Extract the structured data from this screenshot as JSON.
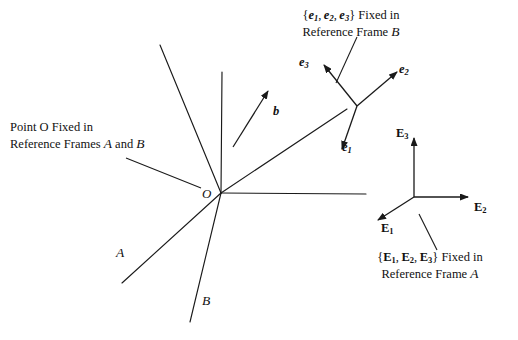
{
  "figure": {
    "type": "vector-frames-diagram",
    "background_color": "#ffffff",
    "line_color": "#1a1a1a"
  },
  "annotations": {
    "point_o_caption_line1": "Point O Fixed in",
    "point_o_caption_line2": "Reference Frames A and B",
    "point_o_caption_line2_parts": {
      "prefix": "Reference Frames ",
      "frame_a": "A",
      "conjunction": " and ",
      "frame_b": "B"
    },
    "e_basis_caption_line1": "{e1, e2, e3} Fixed in",
    "e_basis_caption_line2": "Reference Frame B",
    "E_basis_caption_line1": "{E1, E2, E3} Fixed in",
    "E_basis_caption_line2": "Reference Frame A"
  },
  "labels": {
    "origin": "O",
    "vector_b": "b",
    "e1": "e",
    "e1_sub": "1",
    "e2": "e",
    "e2_sub": "2",
    "e3": "e",
    "e3_sub": "3",
    "E1": "E",
    "E1_sub": "1",
    "E2": "E",
    "E2_sub": "2",
    "E3": "E",
    "E3_sub": "3",
    "frame_A_axis": "A",
    "frame_B_axis": "B"
  },
  "geometry": {
    "origin_point": [
      221,
      193
    ],
    "e_triad_vertex": [
      357,
      106
    ],
    "E_triad_vertex": [
      414,
      197
    ],
    "rays_from_origin": [
      {
        "name": "vertical-up",
        "to": [
          222,
          72
        ]
      },
      {
        "name": "upper-left-diagonal",
        "to": [
          160,
          45
        ]
      },
      {
        "name": "upper-right-long-diagonal",
        "to": [
          347,
          109
        ]
      },
      {
        "name": "horizontal-right",
        "to": [
          366,
          194
        ]
      },
      {
        "name": "lower-left-frame-a",
        "to": [
          122,
          283
        ]
      },
      {
        "name": "lower-down-frame-b",
        "to": [
          190,
          322
        ]
      }
    ],
    "vector_b_arrow": {
      "from": [
        233,
        147
      ],
      "to": [
        269,
        90
      ]
    },
    "e_arrows": {
      "e1": {
        "from": [
          357,
          106
        ],
        "to": [
          341,
          153
        ]
      },
      "e2": {
        "from": [
          357,
          106
        ],
        "to": [
          400,
          69
        ]
      },
      "e3": {
        "from": [
          357,
          106
        ],
        "to": [
          321,
          62
        ]
      }
    },
    "E_arrows": {
      "E1": {
        "from": [
          414,
          197
        ],
        "to": [
          374,
          223
        ]
      },
      "E2": {
        "from": [
          414,
          197
        ],
        "to": [
          472,
          197
        ]
      },
      "E3": {
        "from": [
          414,
          197
        ],
        "to": [
          414,
          134
        ]
      }
    },
    "leader_lines": [
      {
        "name": "point-o-leader",
        "from": [
          126,
          158
        ],
        "to": [
          201,
          188
        ]
      },
      {
        "name": "e-basis-leader",
        "from": [
          357,
          37
        ],
        "to": [
          336,
          83
        ]
      },
      {
        "name": "E-basis-leader",
        "from": [
          437,
          250
        ],
        "to": [
          419,
          214
        ]
      }
    ]
  }
}
